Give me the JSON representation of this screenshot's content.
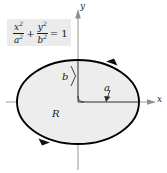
{
  "figure": {
    "equation": {
      "numerator_1": "x",
      "denominator_1": "a",
      "numerator_2": "y",
      "denominator_2": "b",
      "exponent": "2",
      "operator": "+",
      "equals": "= 1",
      "plain_text": "x^2/a^2 + y^2/b^2 = 1",
      "box_color": "#ebebeb"
    },
    "axes": {
      "x_label": "x",
      "y_label": "y",
      "axis_color": "#9a9a9a",
      "origin_x": 78,
      "origin_y": 102
    },
    "labels": {
      "semi_minor": "b",
      "semi_major": "a",
      "region": "R"
    },
    "ellipse": {
      "center_x": 78,
      "center_y": 102,
      "radius_x": 61,
      "radius_y": 42,
      "fill_color": "#ededed",
      "stroke_color": "#000000",
      "stroke_width": 1.8,
      "orientation": "counterclockwise"
    },
    "arrows": {
      "top_right_direction": "counterclockwise",
      "bottom_left_direction": "counterclockwise",
      "a_arrow_label": "a",
      "b_bracket_label": "b"
    }
  }
}
